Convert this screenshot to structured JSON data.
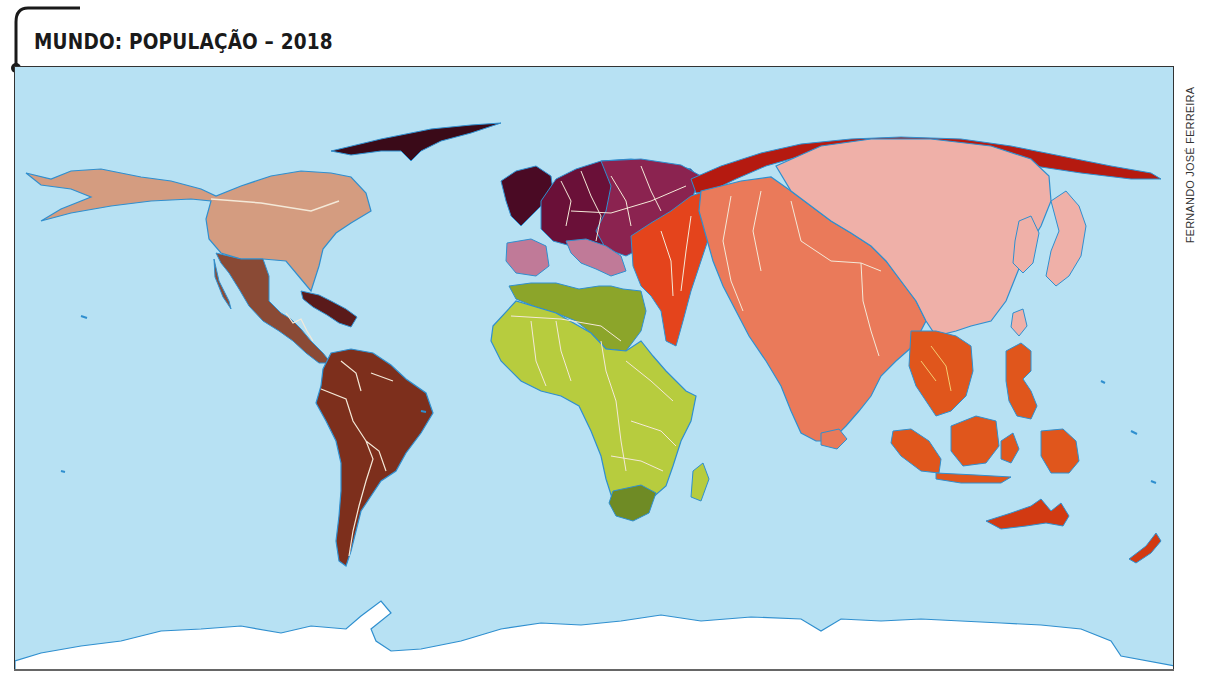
{
  "map": {
    "title": "MUNDO: POPULAÇÃO – 2018",
    "credit": "FERNANDO JOSÉ FERREIRA",
    "type": "cartogram",
    "subject": "world population",
    "year": "2018",
    "colors": {
      "ocean": "#b7e1f3",
      "coastline": "#2f8fcf",
      "border": "#f4e9d8",
      "north_america": "#d49c80",
      "central_america": "#8a4a35",
      "caribbean": "#5a1a1a",
      "south_america": "#7d2f1c",
      "europe_west": "#6a1038",
      "europe_east": "#8b2350",
      "europe_south": "#c07a98",
      "africa_north": "#8ca52a",
      "africa_sub": "#b7cc3e",
      "africa_south": "#6f8b25",
      "russia": "#b51a10",
      "middle_east": "#e4441c",
      "south_asia": "#ea7a5a",
      "east_asia": "#efb0a8",
      "southeast_asia": "#e0561c",
      "oceania": "#d23a12",
      "antarctica": "#ffffff",
      "frame": "#333333"
    }
  }
}
